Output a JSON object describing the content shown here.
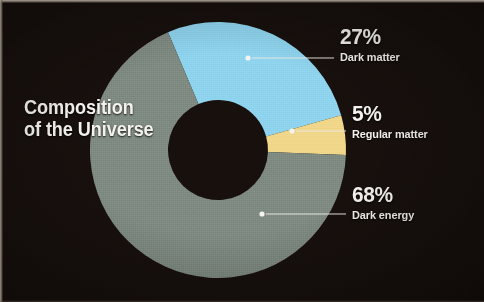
{
  "figure": {
    "title_line1": "Composition",
    "title_line2": "of the Universe",
    "background_color": "#17100d",
    "text_color": "#f4f2ee"
  },
  "chart_data": {
    "type": "pie",
    "variant": "donut",
    "title": "Composition of the Universe",
    "unit": "%",
    "legend_position": "right-callouts",
    "grid": false,
    "center": {
      "x": 218,
      "y": 150
    },
    "outer_radius": 128,
    "inner_radius": 50,
    "start_angle_deg": -23,
    "direction": "clockwise",
    "categories": [
      "Dark matter",
      "Regular matter",
      "Dark energy"
    ],
    "values": [
      27,
      5,
      68
    ],
    "colors": [
      "#8fd4ee",
      "#f0d78a",
      "#7f8b82"
    ],
    "slices": [
      {
        "label": "Dark matter",
        "value": 27,
        "value_label": "27%",
        "color": "#8fd4ee",
        "callout": {
          "dot_x": 248,
          "dot_y": 58,
          "line_end_x": 334,
          "line_end_y": 58
        }
      },
      {
        "label": "Regular matter",
        "value": 5,
        "value_label": "5%",
        "color": "#f0d78a",
        "callout": {
          "dot_x": 292,
          "dot_y": 131,
          "line_end_x": 346,
          "line_end_y": 131
        }
      },
      {
        "label": "Dark energy",
        "value": 68,
        "value_label": "68%",
        "color": "#7f8b82",
        "callout": {
          "dot_x": 262,
          "dot_y": 214,
          "line_end_x": 346,
          "line_end_y": 214
        }
      }
    ]
  },
  "callouts": [
    {
      "pct": "27%",
      "name": "Dark matter"
    },
    {
      "pct": "5%",
      "name": "Regular matter"
    },
    {
      "pct": "68%",
      "name": "Dark energy"
    }
  ]
}
